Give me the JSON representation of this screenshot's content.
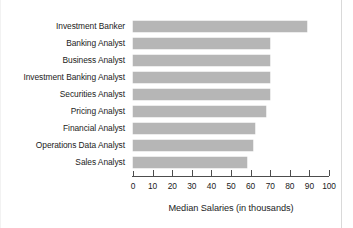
{
  "chart_data": {
    "type": "bar",
    "orientation": "horizontal",
    "title": "",
    "xlabel": "Median Salaries (in thousands)",
    "ylabel": "",
    "xlim": [
      0,
      100
    ],
    "ylim": null,
    "grid": false,
    "legend": null,
    "xticks": [
      0,
      10,
      20,
      30,
      40,
      50,
      60,
      70,
      80,
      90,
      100
    ],
    "xtick_labels": [
      "0",
      "10",
      "20",
      "30",
      "40",
      "50",
      "60",
      "70",
      "80",
      "90",
      "100"
    ],
    "categories": [
      "Investment Banker",
      "Banking Analyst",
      "Business Analyst",
      "Investment Banking Analyst",
      "Securities Analyst",
      "Pricing Analyst",
      "Financial Analyst",
      "Operations Data Analyst",
      "Sales Analyst"
    ],
    "values": [
      89,
      70,
      70,
      70,
      70,
      68,
      62,
      61,
      58
    ],
    "series": [
      {
        "name": "Median Salary",
        "values": [
          89,
          70,
          70,
          70,
          70,
          68,
          62,
          61,
          58
        ]
      }
    ],
    "bar_color": "#b6b6b6",
    "axis_color": "#4d4d4d",
    "text_color": "#1b1b1b",
    "units": "thousands"
  }
}
